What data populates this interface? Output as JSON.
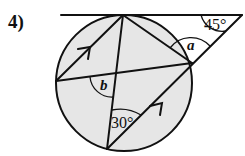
{
  "question": {
    "number": "4)"
  },
  "figure": {
    "type": "circle-theorem-diagram",
    "circle_fill": "#e6e6e6",
    "line_color": "#111111",
    "angles": [
      {
        "label": "45°",
        "position": "between tangent and external line"
      },
      {
        "label": "a",
        "position": "angle at right point between external line and chord to top"
      },
      {
        "label": "b",
        "position": "angle at intersection of chords"
      },
      {
        "label": "30°",
        "position": "angle at bottom point"
      }
    ],
    "parallel_markers": [
      "arrow on chord top-left",
      "arrow on chord bottom-right"
    ]
  }
}
